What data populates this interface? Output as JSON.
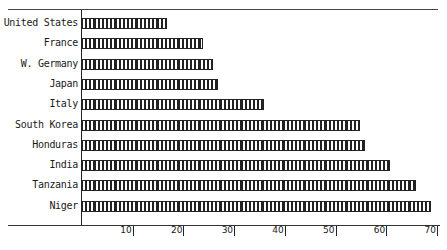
{
  "chart_data": {
    "type": "bar",
    "orientation": "horizontal",
    "title": "",
    "xlabel": "",
    "ylabel": "",
    "categories": [
      "United States",
      "France",
      "W. Germany",
      "Japan",
      "Italy",
      "South Korea",
      "Honduras",
      "India",
      "Tanzania",
      "Niger"
    ],
    "values": [
      17,
      24,
      26,
      27,
      36,
      55,
      56,
      61,
      66,
      69
    ],
    "xlim": [
      0,
      70
    ],
    "xticks": [
      10,
      20,
      30,
      40,
      50,
      60,
      70
    ],
    "grid": false,
    "legend": null,
    "bar_pattern": "vertical-hatch"
  },
  "ticks": [
    {
      "label": "10",
      "value": 10
    },
    {
      "label": "20",
      "value": 20
    },
    {
      "label": "30",
      "value": 30
    },
    {
      "label": "40",
      "value": 40
    },
    {
      "label": "50",
      "value": 50
    },
    {
      "label": "60",
      "value": 60
    },
    {
      "label": "70",
      "value": 70
    }
  ]
}
